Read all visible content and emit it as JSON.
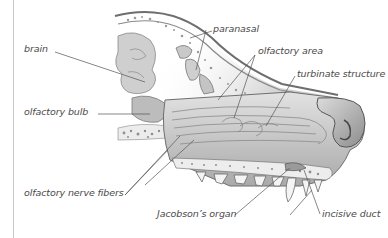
{
  "diagram": {
    "labels": {
      "brain": "brain",
      "olfactory_bulb": "olfactory bulb",
      "olfactory_nerve_fibers": "olfactory nerve fibers",
      "paranasal": "paranasal",
      "olfactory_area": "olfactory area",
      "turbinate_structure": "turbinate structure",
      "jacobsons_organ": "Jacobson’s organ",
      "incisive_duct": "incisive duct"
    },
    "colors": {
      "label_text": "#4a4a4a",
      "leader_line": "#555555",
      "tissue_light": "#d9d9d9",
      "tissue_mid": "#b3b3b3",
      "tissue_dark": "#7a7a7a",
      "bone": "#efefef",
      "border": "#c8c8c8"
    }
  }
}
